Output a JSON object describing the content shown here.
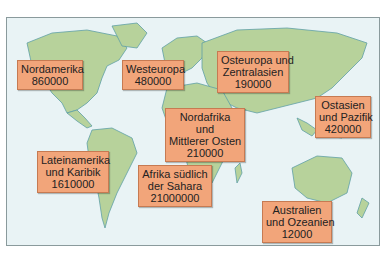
{
  "colors": {
    "ocean": "#e9f3f5",
    "land": "#b7d29b",
    "coast": "#5fa0a6",
    "label_fill": "#f2a57a",
    "label_border": "#c67a52"
  },
  "regions": [
    {
      "name_lines": [
        "Nordamerika"
      ],
      "value": "860000"
    },
    {
      "name_lines": [
        "Westeuropa"
      ],
      "value": "480000"
    },
    {
      "name_lines": [
        "Osteuropa und",
        "Zentralasien"
      ],
      "value": "190000"
    },
    {
      "name_lines": [
        "Ostasien",
        "und Pazifik"
      ],
      "value": "420000"
    },
    {
      "name_lines": [
        "Nordafrika",
        "und",
        "Mittlerer Osten"
      ],
      "value": "210000"
    },
    {
      "name_lines": [
        "Lateinamerika",
        "und Karibik"
      ],
      "value": "1610000"
    },
    {
      "name_lines": [
        "Afrika südlich",
        "der Sahara"
      ],
      "value": "21000000"
    },
    {
      "name_lines": [
        "Australien",
        "und Ozeanien"
      ],
      "value": "12000"
    }
  ]
}
